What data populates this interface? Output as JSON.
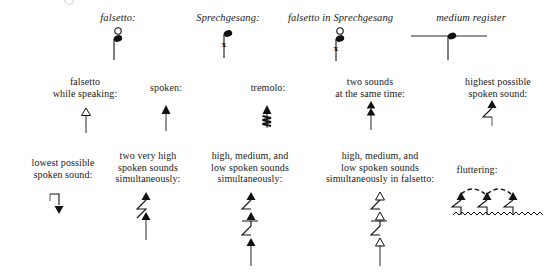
{
  "page": {
    "background_color": "#ffffff",
    "ink_color": "#111111",
    "width": 555,
    "height": 277
  },
  "rows": [
    {
      "name": "row-1-italic-register-labels",
      "items": [
        {
          "key": "falsetto",
          "label": "falsetto:",
          "symbol": "notehead-with-circle-above-stem-down",
          "style": "italic"
        },
        {
          "key": "sprechgesang",
          "label": "Sprechgesang:",
          "symbol": "notehead-with-x-on-stem",
          "style": "italic"
        },
        {
          "key": "falsetto-in-sprechgesang",
          "label": "falsetto in Sprechgesang",
          "symbol": "notehead-with-circle-above-and-x-on-stem",
          "style": "italic"
        },
        {
          "key": "medium-register",
          "label": "medium register",
          "symbol": "notehead-on-horizontal-line-stem-down",
          "style": "italic"
        }
      ]
    },
    {
      "name": "row-2-basic-articulations",
      "items": [
        {
          "key": "falsetto-while-speaking",
          "label": "falsetto\nwhile speaking:",
          "symbol": "hollow-triangle-up-with-stem"
        },
        {
          "key": "spoken",
          "label": "spoken:",
          "symbol": "filled-triangle-up-with-stem"
        },
        {
          "key": "tremolo",
          "label": "tremolo:",
          "symbol": "filled-triangle-up-with-zigzag-stem"
        },
        {
          "key": "two-sounds-at-the-same-time",
          "label": "two sounds\nat the same time:",
          "symbol": "two-stacked-filled-triangles-with-stem"
        },
        {
          "key": "highest-possible-spoken-sound",
          "label": "highest possible\nspoken sound:",
          "symbol": "filled-triangle-with-hooked-flag-stem"
        }
      ]
    },
    {
      "name": "row-3-compound-articulations",
      "items": [
        {
          "key": "lowest-possible-spoken-sound",
          "label": "lowest possible\nspoken sound:",
          "symbol": "filled-triangle-down-with-hooked-flag-stem"
        },
        {
          "key": "two-very-high-spoken-sounds-simultaneously",
          "label": "two very high\nspoken sounds\nsimultaneously:",
          "symbol": "two-filled-triangles-on-zigzag-stem"
        },
        {
          "key": "high-medium-low-spoken-sounds-simultaneously",
          "label": "high, medium, and\nlow spoken sounds\nsimultaneously:",
          "symbol": "three-filled-triangles-on-zigzag-stem"
        },
        {
          "key": "high-medium-low-spoken-sounds-simultaneously-in-falsetto",
          "label": "high, medium, and\nlow spoken sounds\nsimultaneously in falsetto:",
          "symbol": "three-hollow-triangles-on-zigzag-stem"
        },
        {
          "key": "fluttering",
          "label": "fluttering:",
          "symbol": "three-flagged-triangles-with-dashed-slurs-and-wavy-line"
        }
      ]
    }
  ]
}
